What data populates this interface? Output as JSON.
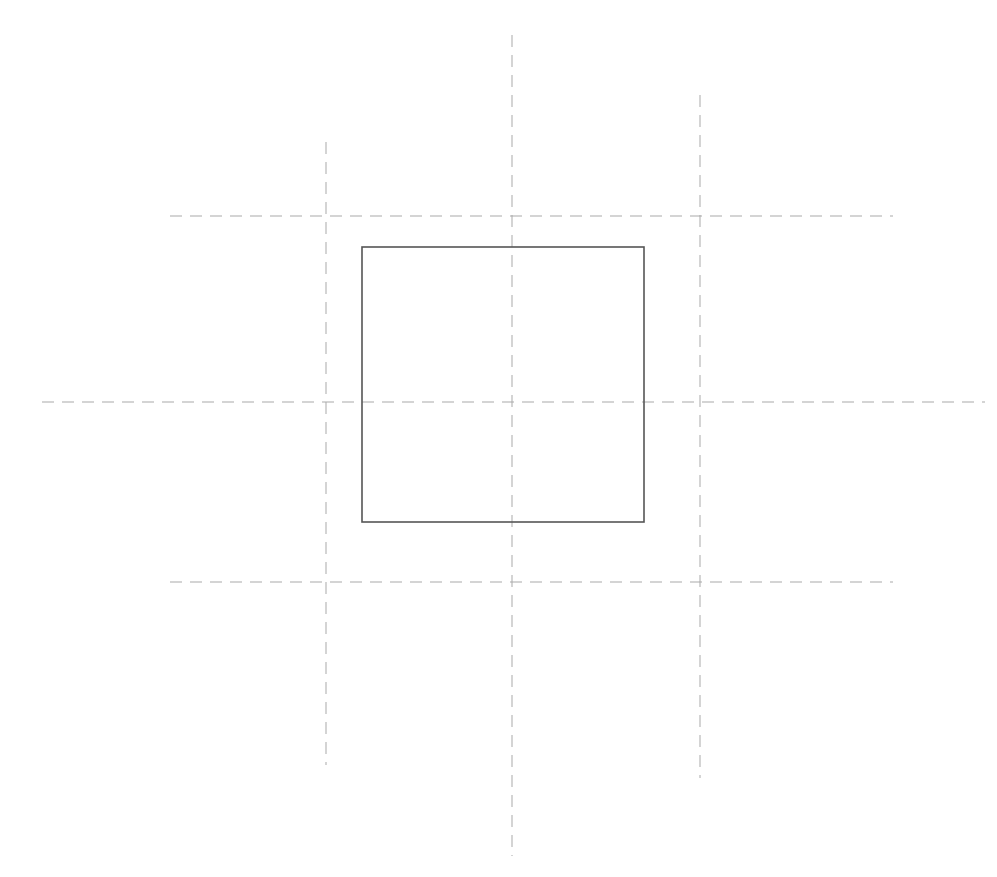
{
  "drawing": {
    "type": "technical-sketch",
    "description": "Square with dashed construction/center lines",
    "colors": {
      "background": "#ffffff",
      "square_stroke": "#555555",
      "dashed_stroke": "#a9a9a9"
    },
    "square": {
      "x": 362,
      "y": 247,
      "width": 282,
      "height": 275
    },
    "horizontal_lines": [
      {
        "id": "top",
        "y": 216,
        "x1": 170,
        "x2": 893
      },
      {
        "id": "middle",
        "y": 402,
        "x1": 42,
        "x2": 985
      },
      {
        "id": "bottom",
        "y": 582,
        "x1": 170,
        "x2": 893
      }
    ],
    "vertical_lines": [
      {
        "id": "left",
        "x": 326,
        "y1": 142,
        "y2": 765
      },
      {
        "id": "center",
        "x": 512,
        "y1": 35,
        "y2": 856
      },
      {
        "id": "right",
        "x": 700,
        "y1": 95,
        "y2": 778
      }
    ],
    "dash_pattern": "12 8"
  }
}
